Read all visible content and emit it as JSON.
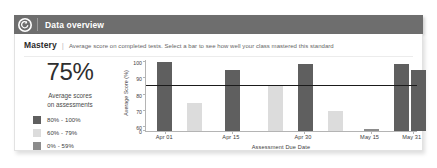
{
  "header": {
    "title": "Data overview",
    "back_icon": "back-arrow-circle-icon",
    "bar_color": "#6e6e6e"
  },
  "mastery": {
    "title": "Mastery",
    "separator": "|",
    "description": "Average score on completed tests. Select a bar to see how well your class mastered this standard"
  },
  "summary": {
    "percent": "75%",
    "caption_line1": "Average scores",
    "caption_line2": "on assessments"
  },
  "legend": {
    "items": [
      {
        "label": "80% - 100%",
        "color": "#5f5f5f"
      },
      {
        "label": "60% - 79%",
        "color": "#dcdcdc"
      },
      {
        "label": "0% - 59%",
        "color": "#8c8c8c"
      }
    ]
  },
  "chart_data": {
    "type": "bar",
    "title": "",
    "xlabel": "Assessment Due Date",
    "ylabel": "Average Score (%)",
    "ylim": [
      0,
      100
    ],
    "ytick_labels": [
      "0",
      "60",
      "70",
      "80",
      "90",
      "100"
    ],
    "ytick_values": [
      0,
      60,
      70,
      80,
      90,
      100
    ],
    "xtick_labels": [
      "Apr 01",
      "Apr 15",
      "Apr 30",
      "May 15",
      "May 31"
    ],
    "grid": false,
    "legend_position": "left-panel",
    "threshold": {
      "value": 85,
      "label": "",
      "color": "#1b1b1b"
    },
    "bars": [
      {
        "x": 0.04,
        "value": 100,
        "band": "80% - 100%",
        "color": "#5f5f5f"
      },
      {
        "x": 0.15,
        "value": 75,
        "band": "60% - 79%",
        "color": "#dcdcdc"
      },
      {
        "x": 0.29,
        "value": 95,
        "band": "80% - 100%",
        "color": "#5f5f5f"
      },
      {
        "x": 0.45,
        "value": 85,
        "band": "60% - 79%",
        "color": "#dcdcdc"
      },
      {
        "x": 0.56,
        "value": 99,
        "band": "80% - 100%",
        "color": "#5f5f5f"
      },
      {
        "x": 0.67,
        "value": 70,
        "band": "60% - 79%",
        "color": "#dcdcdc"
      },
      {
        "x": 0.8,
        "value": 59,
        "band": "0% - 59%",
        "color": "#8c8c8c"
      },
      {
        "x": 0.91,
        "value": 99,
        "band": "80% - 100%",
        "color": "#5f5f5f"
      },
      {
        "x": 0.975,
        "value": 95,
        "band": "80% - 100%",
        "color": "#5f5f5f"
      }
    ],
    "xtick_positions": [
      0.045,
      0.29,
      0.555,
      0.8,
      0.955
    ]
  }
}
